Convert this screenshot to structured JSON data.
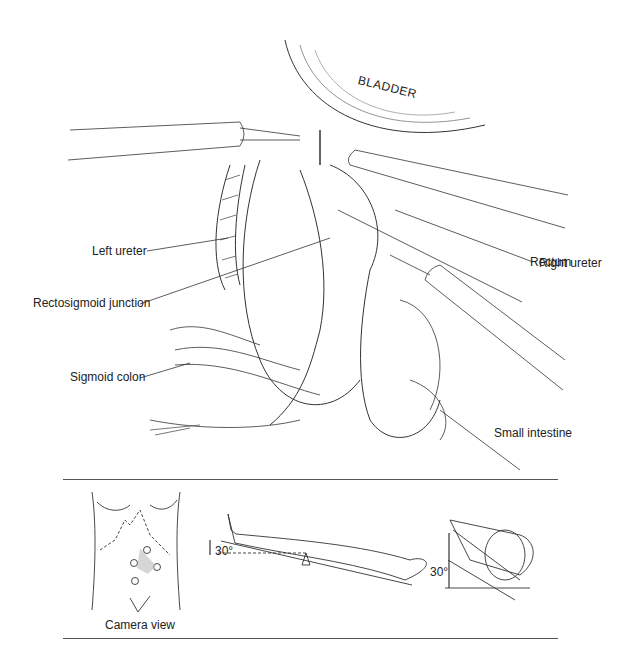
{
  "figure": {
    "anatomy_labels": {
      "bladder": "BLADDER",
      "left_ureter": "Left ureter",
      "right_ureter": "Right ureter",
      "rectum": "Rectum",
      "rectosigmoid_junction": "Rectosigmoid junction",
      "sigmoid_colon": "Sigmoid colon",
      "small_intestine": "Small intestine"
    },
    "inset": {
      "camera_view_caption": "Camera view",
      "tilt_angle_side": "30°",
      "tilt_angle_end": "30°",
      "port_count": 4
    }
  }
}
